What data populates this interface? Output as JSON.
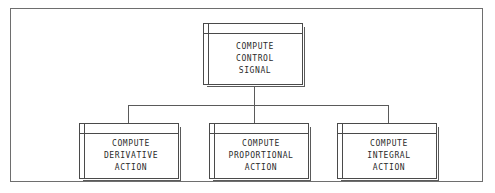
{
  "diagram": {
    "type": "structure-chart",
    "title": "",
    "frame": {
      "visible": true
    },
    "modules": [
      {
        "id": "root",
        "role": "parent",
        "lines": [
          "COMPUTE",
          "CONTROL",
          "SIGNAL"
        ]
      },
      {
        "id": "left",
        "role": "child",
        "lines": [
          "COMPUTE",
          "DERIVATIVE",
          "ACTION"
        ]
      },
      {
        "id": "middle",
        "role": "child",
        "lines": [
          "COMPUTE",
          "PROPORTIONAL",
          "ACTION"
        ]
      },
      {
        "id": "right",
        "role": "child",
        "lines": [
          "COMPUTE",
          "INTEGRAL",
          "ACTION"
        ]
      }
    ],
    "connectors": [
      {
        "id": "stem-root",
        "from": "root",
        "to": "bus",
        "orientation": "vertical"
      },
      {
        "id": "bus",
        "from": "stem-root",
        "to": "children",
        "orientation": "horizontal"
      },
      {
        "id": "drop-left",
        "from": "bus",
        "to": "left",
        "orientation": "vertical"
      },
      {
        "id": "drop-middle",
        "from": "bus",
        "to": "middle",
        "orientation": "vertical"
      },
      {
        "id": "drop-right",
        "from": "bus",
        "to": "right",
        "orientation": "vertical"
      }
    ],
    "colors": {
      "background": "#ffffff",
      "frame_border": "#6e6e6e",
      "box_border": "#4a4a4a",
      "box_shadow": "#5a5a5a",
      "connector": "#5a5a5a",
      "text": "#2b2b2b"
    }
  }
}
